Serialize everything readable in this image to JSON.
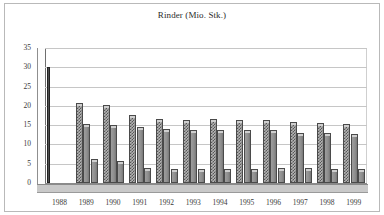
{
  "chart_data": {
    "type": "bar",
    "title": "Rinder (Mio. Stk.)",
    "xlabel": "",
    "ylabel": "",
    "ylim": [
      0,
      35
    ],
    "yticks": [
      0,
      5,
      10,
      15,
      20,
      25,
      30,
      35
    ],
    "grid": true,
    "legend": "none",
    "style": "3d-clustered-column",
    "categories": [
      "1988",
      "1989",
      "1990",
      "1991",
      "1992",
      "1993",
      "1994",
      "1995",
      "1996",
      "1997",
      "1998",
      "1999"
    ],
    "series": [
      {
        "name": "Serie 1",
        "fill": "checkered",
        "values": [
          30.0,
          20.3,
          19.8,
          17.0,
          16.2,
          15.9,
          16.0,
          15.9,
          15.7,
          15.3,
          15.0,
          14.9
        ]
      },
      {
        "name": "Serie 2",
        "fill": "solid-grey",
        "values": [
          null,
          14.7,
          14.6,
          14.0,
          13.5,
          13.2,
          13.1,
          13.3,
          13.1,
          12.5,
          12.4,
          12.2
        ]
      },
      {
        "name": "Serie 3",
        "fill": "solid-grey",
        "values": [
          null,
          5.8,
          5.1,
          3.5,
          3.1,
          3.1,
          3.2,
          3.2,
          3.3,
          3.3,
          3.0,
          3.2
        ]
      }
    ]
  },
  "colors": {
    "plot_background": "#ffffff",
    "gridline": "#c6c6c6",
    "axis": "#6e6e6e",
    "floor": "#c9c9c9",
    "bar_series1": "#b4b4b4",
    "bar_series2": "#8e8e8e",
    "bar_series3": "#8e8e8e",
    "text": "#3a3a3a",
    "frame": "#b9b9b9"
  }
}
